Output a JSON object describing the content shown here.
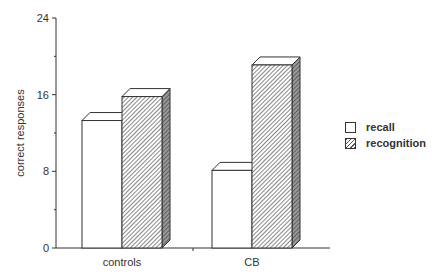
{
  "chart_data": {
    "type": "bar",
    "title": "",
    "xlabel": "",
    "ylabel": "correct responses",
    "ylim": [
      0,
      24
    ],
    "yticks": [
      0,
      8,
      16,
      24
    ],
    "grid": false,
    "legend_position": "right",
    "style": "3d-bars",
    "categories": [
      "controls",
      "CB"
    ],
    "series": [
      {
        "name": "recall",
        "pattern": "none",
        "values": [
          13.3,
          8.1
        ]
      },
      {
        "name": "recognition",
        "pattern": "diagonal-hatch",
        "values": [
          15.8,
          19.1
        ]
      }
    ]
  },
  "colors": {
    "axis": "#333333",
    "recall_fill": "#ffffff",
    "hatch": "#555555",
    "side_shade": "#888888"
  }
}
